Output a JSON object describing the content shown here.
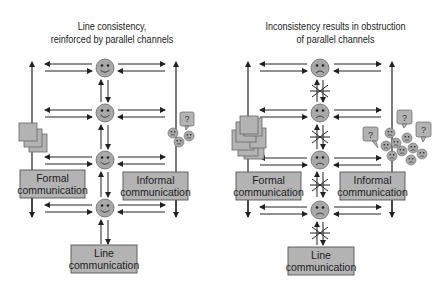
{
  "panels": [
    {
      "id": "consistent",
      "title_line1": "Line consistency,",
      "title_line2": "reinforced by parallel channels",
      "face_mood": "smiley",
      "channels_obstructed": false,
      "boxes": {
        "formal_line1": "Formal",
        "formal_line2": "communication",
        "informal_line1": "Informal",
        "informal_line2": "communication",
        "line_line1": "Line",
        "line_line2": "communication"
      },
      "question_bubbles": [
        "?"
      ]
    },
    {
      "id": "inconsistent",
      "title_line1": "Inconsistency results in obstruction",
      "title_line2": "of parallel channels",
      "face_mood": "frowny",
      "channels_obstructed": true,
      "boxes": {
        "formal_line1": "Formal",
        "formal_line2": "communication",
        "informal_line1": "Informal",
        "informal_line2": "communication",
        "line_line1": "Line",
        "line_line2": "communication"
      },
      "question_bubbles": [
        "?",
        "?",
        "?"
      ]
    }
  ],
  "colors": {
    "box_fill": "#b3b3b3",
    "box_stroke": "#555555",
    "face_fill": "#a8a8a8",
    "line": "#222222"
  }
}
